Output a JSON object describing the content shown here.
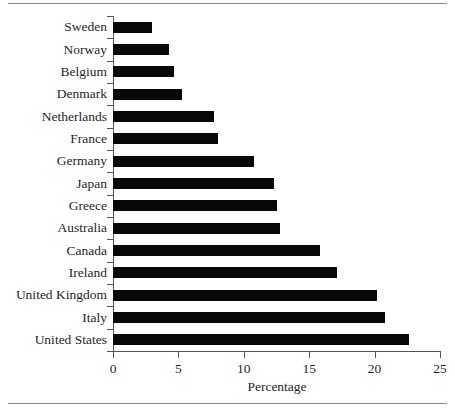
{
  "figure": {
    "has_top_rule": true,
    "has_bottom_rule": true,
    "background": "#ffffff",
    "bar_color": "#080808",
    "axis_color": "#555555",
    "text_color": "#1f1f1f"
  },
  "chart_data": {
    "type": "bar",
    "orientation": "horizontal",
    "title": "",
    "xlabel": "Percentage",
    "ylabel": "",
    "xlim": [
      0,
      25
    ],
    "xticks": [
      0,
      5,
      10,
      15,
      20,
      25
    ],
    "xtick_labels": [
      "0",
      "5",
      "10",
      "15",
      "20",
      "25"
    ],
    "grid": false,
    "legend": null,
    "categories": [
      "Sweden",
      "Norway",
      "Belgium",
      "Denmark",
      "Netherlands",
      "France",
      "Germany",
      "Japan",
      "Greece",
      "Australia",
      "Canada",
      "Ireland",
      "United Kingdom",
      "Italy",
      "United States"
    ],
    "values": [
      3.0,
      4.3,
      4.7,
      5.3,
      7.7,
      8.0,
      10.8,
      12.3,
      12.5,
      12.8,
      15.8,
      17.1,
      20.2,
      20.8,
      22.6
    ]
  }
}
